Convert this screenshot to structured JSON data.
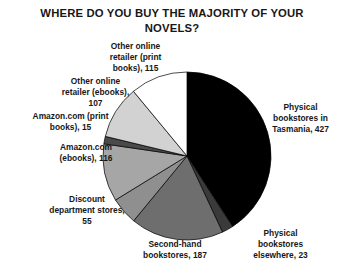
{
  "chart_data": {
    "type": "pie",
    "title": "WHERE DO YOU BUY THE MAJORITY OF YOUR NOVELS?",
    "xlabel": "",
    "ylabel": "",
    "total": 1045,
    "start_angle": 0,
    "direction": "clockwise",
    "legend_position": "none",
    "grid": false,
    "labels_show_value": true,
    "categories": [
      "Physical bookstores in Tasmania",
      "Physical bookstores elsewhere",
      "Second-hand bookstores",
      "Discount department stores",
      "Amazon.com (ebooks)",
      "Amazon.com (print books)",
      "Other online retailer (ebooks)",
      "Other online retailer (print books)"
    ],
    "values": [
      427,
      23,
      187,
      55,
      116,
      15,
      107,
      115
    ],
    "colors": [
      "#000000",
      "#3a3a3a",
      "#6e6e6e",
      "#8f8f8f",
      "#a6a6a6",
      "#4a4a4a",
      "#d2d2d2",
      "#ffffff"
    ],
    "slices": [
      {
        "label": "Physical bookstores in Tasmania",
        "value": 427,
        "color": "#000000",
        "annotation": "Physical bookstores in Tasmania, 427"
      },
      {
        "label": "Physical bookstores elsewhere",
        "value": 23,
        "color": "#3a3a3a",
        "annotation": "Physical bookstores elsewhere, 23"
      },
      {
        "label": "Second-hand bookstores",
        "value": 187,
        "color": "#6e6e6e",
        "annotation": "Second-hand bookstores, 187"
      },
      {
        "label": "Discount department stores",
        "value": 55,
        "color": "#8f8f8f",
        "annotation": "Discount department stores, 55"
      },
      {
        "label": "Amazon.com (ebooks)",
        "value": 116,
        "color": "#a6a6a6",
        "annotation": "Amazon.com (ebooks), 116"
      },
      {
        "label": "Amazon.com (print books)",
        "value": 15,
        "color": "#4a4a4a",
        "annotation": "Amazon.com (print books), 15"
      },
      {
        "label": "Other online retailer (ebooks)",
        "value": 107,
        "color": "#d2d2d2",
        "annotation": "Other online retailer (ebooks), 107"
      },
      {
        "label": "Other online retailer (print books)",
        "value": 115,
        "color": "#ffffff",
        "annotation": "Other online retailer (print books), 115"
      }
    ]
  },
  "annotations": {
    "tasmania": "Physical\nbookstores in\nTasmania, 427",
    "elsewhere": "Physical\nbookstores\nelsewhere, 23",
    "secondhand": "Second-hand\nbookstores, 187",
    "discount": "Discount\ndepartment stores,\n55",
    "amazon_ebooks": "Amazon.com\n(ebooks), 116",
    "amazon_print": "Amazon.com (print\nbooks), 15",
    "other_ebooks": "Other online\nretailer (ebooks),\n107",
    "other_print": "Other online\nretailer (print\nbooks), 115"
  },
  "geometry": {
    "center_x": 187,
    "center_y": 156,
    "radius": 84,
    "outline_color": "#000000"
  }
}
